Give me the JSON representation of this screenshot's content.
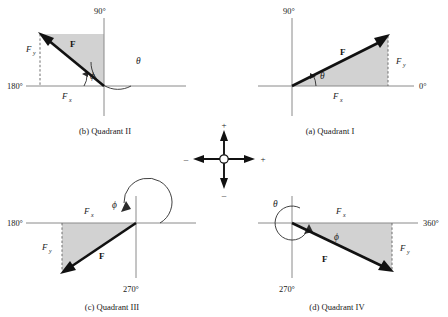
{
  "figure": {
    "background": "#ffffff",
    "shade_color": "#d2d2d2",
    "vector_color": "#111111",
    "axis_color": "#8a8a8a"
  },
  "symbols": {
    "vector": "F",
    "fx": "F",
    "fy": "F",
    "fx_sub": "x",
    "fy_sub": "y",
    "theta": "θ",
    "phi": "ϕ",
    "plus": "+",
    "minus": "–"
  },
  "panels": [
    {
      "id": "quadrant-2",
      "caption": "(b) Quadrant II",
      "axis_labels": {
        "left": "180°",
        "top": "90°"
      },
      "angles": [
        "θ",
        "ϕ"
      ],
      "components": [
        "F",
        "F"
      ],
      "vector_label": "F",
      "direction": "up-left"
    },
    {
      "id": "quadrant-1",
      "caption": "(a) Quadrant I",
      "axis_labels": {
        "top": "90°",
        "right": "0°"
      },
      "angles": [
        "θ"
      ],
      "components": [
        "F",
        "F"
      ],
      "vector_label": "F",
      "direction": "up-right"
    },
    {
      "id": "quadrant-3",
      "caption": "(c) Quadrant III",
      "axis_labels": {
        "left": "180°",
        "bottom": "270°"
      },
      "angles": [
        "ϕ"
      ],
      "components": [
        "F",
        "F"
      ],
      "vector_label": "F",
      "direction": "down-left"
    },
    {
      "id": "quadrant-4",
      "caption": "(d) Quadrant IV",
      "axis_labels": {
        "bottom": "270°",
        "right": "360°"
      },
      "angles": [
        "θ",
        "ϕ"
      ],
      "components": [
        "F",
        "F"
      ],
      "vector_label": "F",
      "direction": "down-right"
    }
  ],
  "sign_convention": {
    "id": "sign-compass",
    "up": "+",
    "right": "+",
    "left": "–",
    "down": "–"
  }
}
